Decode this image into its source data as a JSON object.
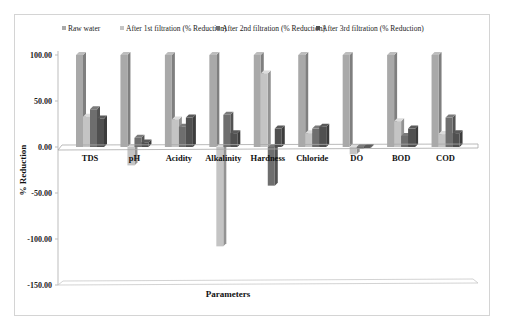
{
  "chart_data": {
    "type": "bar",
    "title": "",
    "xlabel": "Parameters",
    "ylabel": "% Reduction",
    "ylim": [
      -150,
      100
    ],
    "yticks": [
      "100.00",
      "50.00",
      "0.00",
      "-50.00",
      "-100.00",
      "-150.00"
    ],
    "ytick_values": [
      100,
      50,
      0,
      -50,
      -100,
      -150
    ],
    "grid": false,
    "legend_position": "top",
    "categories": [
      "TDS",
      "pH",
      "Acidity",
      "Alkalinity",
      "Hardness",
      "Chloride",
      "DO",
      "BOD",
      "COD"
    ],
    "series": [
      {
        "name": "Raw water",
        "color": "#a9a9a9",
        "values": [
          100,
          100,
          100,
          100,
          100,
          100,
          100,
          100,
          100
        ]
      },
      {
        "name": "After 1st  filtration (% Reduction)",
        "color": "#c4c4c4",
        "values": [
          33,
          -20,
          30,
          -108,
          80,
          15,
          -8,
          28,
          14
        ]
      },
      {
        "name": "After 2nd   filtration (% Reduction)",
        "color": "#6e6e6e",
        "values": [
          41,
          10,
          22,
          35,
          -42,
          20,
          -2,
          12,
          32
        ]
      },
      {
        "name": "After 3rd filtration (% Reduction)",
        "color": "#505050",
        "values": [
          31,
          5,
          32,
          15,
          20,
          22,
          -1,
          20,
          15
        ]
      }
    ]
  }
}
